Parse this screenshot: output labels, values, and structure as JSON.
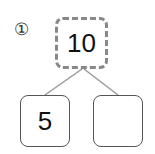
{
  "problem": {
    "number": "①"
  },
  "number_bond": {
    "whole": "10",
    "parts": [
      "5",
      ""
    ]
  }
}
